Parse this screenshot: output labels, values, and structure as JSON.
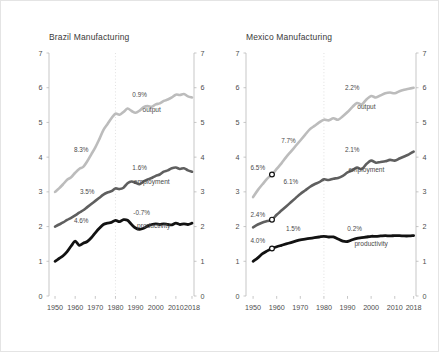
{
  "figure": {
    "background": "#ffffff",
    "border_color": "#e4e4e4"
  },
  "colors": {
    "output": "#bcbcbc",
    "employment": "#5f5f5f",
    "productivity": "#121212",
    "axis": "#b9b9b9",
    "divider": "#d9d9d9",
    "text": "#4a4a4a"
  },
  "panels": [
    {
      "key": "brazil",
      "title": "Brazil Manufacturing",
      "series_labels": {
        "output": "output",
        "employment": "employment",
        "productivity": "productivity"
      },
      "annotations": [
        {
          "text": "8.3%",
          "series": "output",
          "x": 1963,
          "y": 4.15
        },
        {
          "text": "0.9%",
          "series": "output",
          "x": 1992,
          "y": 5.72
        },
        {
          "text": "3.5%",
          "series": "employment",
          "x": 1966,
          "y": 2.93
        },
        {
          "text": "1.6%",
          "series": "employment",
          "x": 1992,
          "y": 3.62
        },
        {
          "text": "4.6%",
          "series": "productivity",
          "x": 1963,
          "y": 2.1
        },
        {
          "text": "-0.7%",
          "series": "productivity",
          "x": 1993,
          "y": 2.33
        }
      ],
      "markers": []
    },
    {
      "key": "mexico",
      "title": "Mexico Manufacturing",
      "series_labels": {
        "output": "output",
        "employment": "employment",
        "productivity": "productivity"
      },
      "annotations": [
        {
          "text": "7.7%",
          "series": "output",
          "x": 1965,
          "y": 4.42
        },
        {
          "text": "2.2%",
          "series": "output",
          "x": 1992,
          "y": 5.93
        },
        {
          "text": "6.5%",
          "series": "output",
          "x": 1952,
          "y": 3.62
        },
        {
          "text": "2.4%",
          "series": "employment",
          "x": 1952,
          "y": 2.28
        },
        {
          "text": "6.1%",
          "series": "employment",
          "x": 1966,
          "y": 3.22
        },
        {
          "text": "2.1%",
          "series": "employment",
          "x": 1992,
          "y": 4.16
        },
        {
          "text": "4.0%",
          "series": "productivity",
          "x": 1952,
          "y": 1.52
        },
        {
          "text": "1.5%",
          "series": "productivity",
          "x": 1967,
          "y": 1.88
        },
        {
          "text": "0.2%",
          "series": "productivity",
          "x": 1993,
          "y": 1.88
        }
      ],
      "markers": [
        {
          "series": "output",
          "x": 1958,
          "y": 3.5
        },
        {
          "series": "employment",
          "x": 1958,
          "y": 2.2
        },
        {
          "series": "productivity",
          "x": 1958,
          "y": 1.37
        }
      ]
    }
  ],
  "chart_data": {
    "type": "line",
    "panel_titles": [
      "Brazil Manufacturing",
      "Mexico Manufacturing"
    ],
    "xlabel": "",
    "ylabel": "",
    "xlim": [
      1947,
      2019
    ],
    "ylim": [
      0,
      7
    ],
    "yticks": [
      0,
      1,
      2,
      3,
      4,
      5,
      6,
      7
    ],
    "xticks": [
      1950,
      1960,
      1970,
      1980,
      1990,
      2000,
      2010,
      2018
    ],
    "xticklabels": [
      "1950",
      "1960",
      "1970",
      "1980",
      "1990",
      "2000",
      "2010",
      "2018"
    ],
    "yticklabels": [
      "0",
      "1",
      "2",
      "3",
      "4",
      "5",
      "6",
      "7"
    ],
    "grid": false,
    "right_axis_mirrored": true,
    "vertical_reference_line": 1980,
    "legend": "inline-labels",
    "legend_position": "inline right of each series",
    "series_names": [
      "output",
      "employment",
      "productivity"
    ],
    "growth_annotations": {
      "brazil": {
        "output": {
          "1950-1980": "8.3%",
          "1980-2018": "0.9%"
        },
        "employment": {
          "1950-1980": "3.5%",
          "1980-2018": "1.6%"
        },
        "productivity": {
          "1950-1980": "4.6%",
          "1980-2018": "-0.7%"
        }
      },
      "mexico": {
        "output": {
          "1950-1980": "7.7%",
          "1980-2018": "2.2%",
          "marker": "6.5%"
        },
        "employment": {
          "1950-1980": "6.1%",
          "1980-2018": "2.1%",
          "marker": "2.4%"
        },
        "productivity": {
          "1950-1980": "1.5%",
          "1980-2018": "0.2%",
          "marker": "4.0%"
        }
      }
    },
    "panels": [
      {
        "name": "Brazil Manufacturing",
        "x": [
          1950,
          1952,
          1954,
          1956,
          1958,
          1960,
          1962,
          1964,
          1966,
          1968,
          1970,
          1972,
          1974,
          1976,
          1978,
          1980,
          1982,
          1984,
          1986,
          1988,
          1990,
          1992,
          1994,
          1996,
          1998,
          2000,
          2002,
          2004,
          2006,
          2008,
          2010,
          2012,
          2014,
          2016,
          2018
        ],
        "series": [
          {
            "name": "output",
            "color": "#bcbcbc",
            "values": [
              3.0,
              3.1,
              3.22,
              3.35,
              3.42,
              3.55,
              3.66,
              3.72,
              3.88,
              4.08,
              4.28,
              4.52,
              4.78,
              4.95,
              5.12,
              5.25,
              5.22,
              5.3,
              5.4,
              5.33,
              5.28,
              5.34,
              5.44,
              5.47,
              5.45,
              5.52,
              5.55,
              5.62,
              5.66,
              5.72,
              5.8,
              5.79,
              5.82,
              5.75,
              5.72
            ]
          },
          {
            "name": "employment",
            "color": "#5f5f5f",
            "values": [
              2.0,
              2.06,
              2.12,
              2.19,
              2.25,
              2.32,
              2.4,
              2.47,
              2.56,
              2.65,
              2.74,
              2.83,
              2.92,
              2.98,
              3.02,
              3.1,
              3.08,
              3.12,
              3.25,
              3.3,
              3.26,
              3.22,
              3.3,
              3.36,
              3.4,
              3.46,
              3.5,
              3.58,
              3.62,
              3.68,
              3.7,
              3.66,
              3.68,
              3.62,
              3.58
            ]
          },
          {
            "name": "productivity",
            "color": "#121212",
            "values": [
              1.0,
              1.08,
              1.16,
              1.28,
              1.44,
              1.58,
              1.46,
              1.52,
              1.57,
              1.68,
              1.82,
              1.95,
              2.06,
              2.1,
              2.12,
              2.18,
              2.14,
              2.2,
              2.18,
              2.06,
              1.96,
              1.92,
              1.95,
              2.02,
              2.06,
              2.08,
              2.06,
              2.08,
              2.06,
              2.05,
              2.1,
              2.06,
              2.08,
              2.06,
              2.1
            ]
          }
        ]
      },
      {
        "name": "Mexico Manufacturing",
        "x": [
          1950,
          1952,
          1954,
          1956,
          1958,
          1960,
          1962,
          1964,
          1966,
          1968,
          1970,
          1972,
          1974,
          1976,
          1978,
          1980,
          1982,
          1984,
          1986,
          1988,
          1990,
          1992,
          1994,
          1996,
          1998,
          2000,
          2002,
          2004,
          2006,
          2008,
          2010,
          2012,
          2014,
          2016,
          2018
        ],
        "series": [
          {
            "name": "output",
            "color": "#bcbcbc",
            "values": [
              2.85,
              3.05,
              3.22,
              3.38,
              3.5,
              3.66,
              3.82,
              4.0,
              4.16,
              4.32,
              4.48,
              4.64,
              4.8,
              4.9,
              5.0,
              5.08,
              5.06,
              5.12,
              5.08,
              5.18,
              5.3,
              5.44,
              5.56,
              5.52,
              5.66,
              5.76,
              5.72,
              5.78,
              5.84,
              5.86,
              5.84,
              5.9,
              5.94,
              5.97,
              6.0
            ]
          },
          {
            "name": "employment",
            "color": "#5f5f5f",
            "values": [
              1.98,
              2.06,
              2.12,
              2.16,
              2.2,
              2.34,
              2.46,
              2.58,
              2.7,
              2.82,
              2.94,
              3.04,
              3.14,
              3.22,
              3.28,
              3.36,
              3.34,
              3.38,
              3.4,
              3.46,
              3.56,
              3.62,
              3.7,
              3.66,
              3.8,
              3.9,
              3.84,
              3.86,
              3.88,
              3.92,
              3.9,
              3.96,
              4.02,
              4.08,
              4.16
            ]
          },
          {
            "name": "productivity",
            "color": "#121212",
            "values": [
              1.0,
              1.1,
              1.22,
              1.3,
              1.37,
              1.42,
              1.46,
              1.5,
              1.54,
              1.58,
              1.62,
              1.64,
              1.66,
              1.68,
              1.7,
              1.72,
              1.7,
              1.7,
              1.64,
              1.58,
              1.57,
              1.62,
              1.66,
              1.68,
              1.7,
              1.72,
              1.72,
              1.73,
              1.74,
              1.73,
              1.74,
              1.74,
              1.73,
              1.73,
              1.74
            ]
          }
        ]
      }
    ]
  }
}
